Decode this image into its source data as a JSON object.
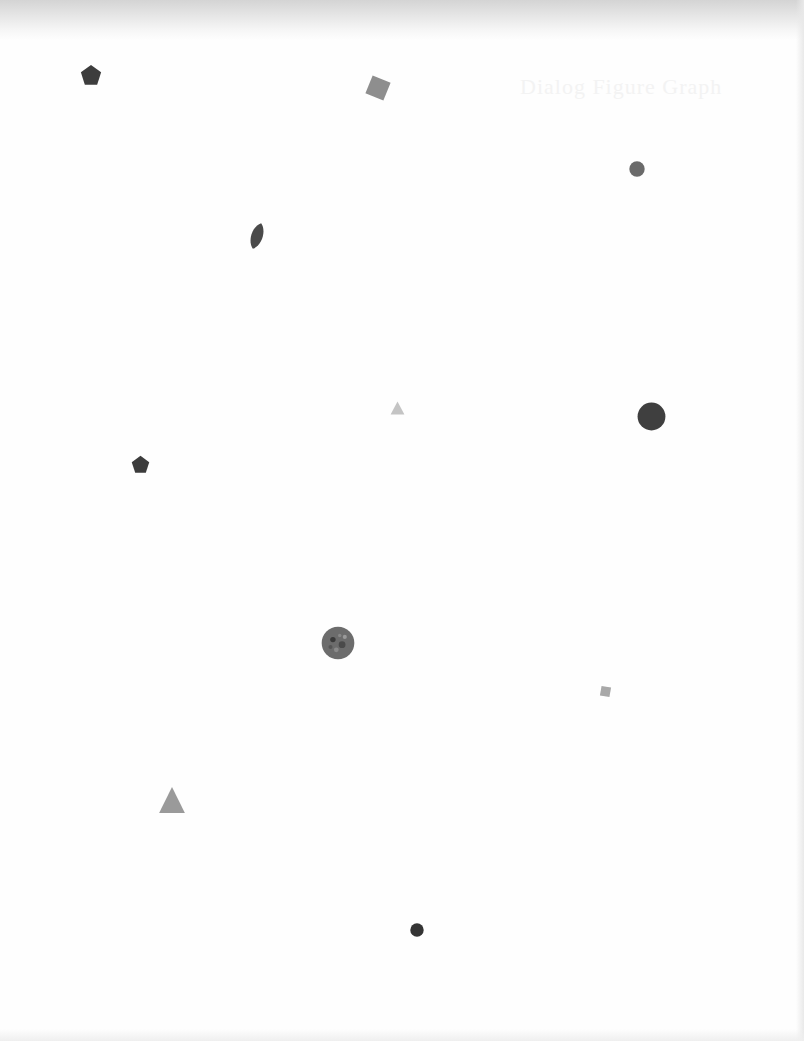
{
  "page": {
    "background": "#fefefe",
    "ghost_text": "Dialog Figure Graph"
  },
  "shapes": [
    {
      "id": "pentagon-1",
      "type": "pentagon",
      "x": 80,
      "y": 64,
      "w": 22,
      "h": 22,
      "rotate": 0,
      "color": "#3d3d3d"
    },
    {
      "id": "square-1",
      "type": "square",
      "x": 367,
      "y": 77,
      "w": 22,
      "h": 22,
      "rotate": 22,
      "color": "#8e8e8e"
    },
    {
      "id": "circle-1",
      "type": "circle",
      "x": 629,
      "y": 161,
      "w": 16,
      "h": 16,
      "rotate": 0,
      "color": "#6a6a6a"
    },
    {
      "id": "leaf-1",
      "type": "leaf",
      "x": 247,
      "y": 222,
      "w": 20,
      "h": 28,
      "rotate": 18,
      "color": "#4a4a4a"
    },
    {
      "id": "triangle-1",
      "type": "triangle",
      "x": 390,
      "y": 401,
      "w": 15,
      "h": 14,
      "rotate": 0,
      "color": "#c4c4c4"
    },
    {
      "id": "circle-2",
      "type": "circle",
      "x": 637,
      "y": 402,
      "w": 29,
      "h": 29,
      "rotate": 0,
      "color": "#3f3f3f"
    },
    {
      "id": "pentagon-2",
      "type": "pentagon",
      "x": 131,
      "y": 455,
      "w": 19,
      "h": 19,
      "rotate": 0,
      "color": "#3c3c3c"
    },
    {
      "id": "circle-3",
      "type": "circle",
      "x": 321,
      "y": 626,
      "w": 34,
      "h": 34,
      "rotate": 0,
      "color": "#6c6c6c",
      "textured": true
    },
    {
      "id": "square-2",
      "type": "square",
      "x": 600,
      "y": 686,
      "w": 11,
      "h": 11,
      "rotate": 10,
      "color": "#a8a8a8"
    },
    {
      "id": "triangle-2",
      "type": "triangle",
      "x": 158,
      "y": 786,
      "w": 28,
      "h": 28,
      "rotate": 0,
      "color": "#9a9a9a"
    },
    {
      "id": "circle-4",
      "type": "circle",
      "x": 410,
      "y": 923,
      "w": 14,
      "h": 14,
      "rotate": 0,
      "color": "#343434"
    }
  ]
}
